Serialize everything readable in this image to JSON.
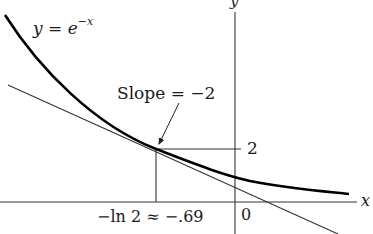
{
  "diagram": {
    "curve_label": "y = e",
    "curve_label_exponent": "−x",
    "slope_label": "Slope = −2",
    "y_axis_label": "y",
    "x_axis_label": "x",
    "y_tick_label": "2",
    "origin_label": "0",
    "x_point_label": "−ln 2 ≈ −.69",
    "colors": {
      "curve": "#000000",
      "lines": "#333333",
      "text": "#1a1a1a"
    }
  }
}
